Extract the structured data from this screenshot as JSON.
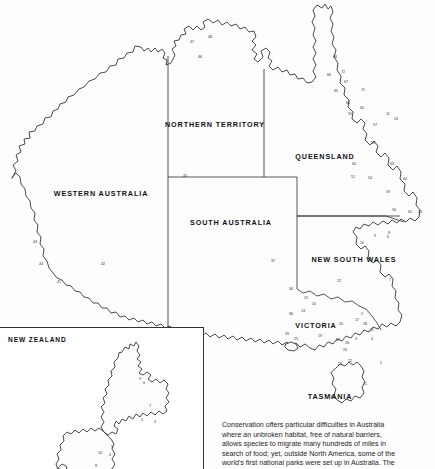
{
  "document": {
    "title": "Australia and New Zealand national parks map"
  },
  "main_map": {
    "name": "australia",
    "state_labels": [
      {
        "id": "western-australia",
        "text": "WESTERN AUSTRALIA",
        "x": 101,
        "y": 193
      },
      {
        "id": "northern-territory",
        "text": "NORTHERN TERRITORY",
        "x": 215,
        "y": 124
      },
      {
        "id": "south-australia",
        "text": "SOUTH AUSTRALIA",
        "x": 231,
        "y": 222
      },
      {
        "id": "queensland",
        "text": "QUEENSLAND",
        "x": 325,
        "y": 156
      },
      {
        "id": "new-south-wales",
        "text": "NEW SOUTH WALES",
        "x": 354,
        "y": 259
      },
      {
        "id": "victoria",
        "text": "VICTORIA",
        "x": 316,
        "y": 325
      },
      {
        "id": "tasmania",
        "text": "TASMANIA",
        "x": 330,
        "y": 396
      }
    ],
    "park_numbers": [
      {
        "n": "48",
        "x": 210,
        "y": 38
      },
      {
        "n": "47",
        "x": 192,
        "y": 43
      },
      {
        "n": "46",
        "x": 200,
        "y": 58
      },
      {
        "n": "45",
        "x": 185,
        "y": 177
      },
      {
        "n": "43",
        "x": 35,
        "y": 243
      },
      {
        "n": "44",
        "x": 41,
        "y": 265
      },
      {
        "n": "42",
        "x": 103,
        "y": 265
      },
      {
        "n": "41",
        "x": 59,
        "y": 283
      },
      {
        "n": "37",
        "x": 273,
        "y": 262
      },
      {
        "n": "68",
        "x": 335,
        "y": 58
      },
      {
        "n": "66",
        "x": 329,
        "y": 76
      },
      {
        "n": "72",
        "x": 343,
        "y": 73
      },
      {
        "n": "67",
        "x": 346,
        "y": 83
      },
      {
        "n": "65",
        "x": 336,
        "y": 92
      },
      {
        "n": "71",
        "x": 363,
        "y": 91
      },
      {
        "n": "61",
        "x": 348,
        "y": 104
      },
      {
        "n": "65",
        "x": 362,
        "y": 109
      },
      {
        "n": "55",
        "x": 350,
        "y": 115
      },
      {
        "n": "11",
        "x": 388,
        "y": 115
      },
      {
        "n": "14",
        "x": 396,
        "y": 120
      },
      {
        "n": "57",
        "x": 375,
        "y": 126
      },
      {
        "n": "58",
        "x": 373,
        "y": 144
      },
      {
        "n": "64",
        "x": 354,
        "y": 165
      },
      {
        "n": "63",
        "x": 392,
        "y": 165
      },
      {
        "n": "51",
        "x": 353,
        "y": 178
      },
      {
        "n": "54",
        "x": 370,
        "y": 179
      },
      {
        "n": "64",
        "x": 405,
        "y": 180
      },
      {
        "n": "59",
        "x": 388,
        "y": 193
      },
      {
        "n": "56",
        "x": 394,
        "y": 211
      },
      {
        "n": "62",
        "x": 410,
        "y": 213
      },
      {
        "n": "53",
        "x": 420,
        "y": 213
      },
      {
        "n": "9",
        "x": 375,
        "y": 237
      },
      {
        "n": "6",
        "x": 388,
        "y": 238
      },
      {
        "n": "8",
        "x": 389,
        "y": 234
      },
      {
        "n": "10",
        "x": 362,
        "y": 244
      },
      {
        "n": "7",
        "x": 390,
        "y": 281
      },
      {
        "n": "12",
        "x": 339,
        "y": 282
      },
      {
        "n": "34",
        "x": 291,
        "y": 290
      },
      {
        "n": "15",
        "x": 306,
        "y": 299
      },
      {
        "n": "16",
        "x": 314,
        "y": 305
      },
      {
        "n": "13",
        "x": 303,
        "y": 312
      },
      {
        "n": "36",
        "x": 291,
        "y": 315
      },
      {
        "n": "20",
        "x": 341,
        "y": 325
      },
      {
        "n": "17",
        "x": 357,
        "y": 321
      },
      {
        "n": "18",
        "x": 365,
        "y": 325
      },
      {
        "n": "2",
        "x": 362,
        "y": 315
      },
      {
        "n": "31",
        "x": 372,
        "y": 331
      },
      {
        "n": "19",
        "x": 320,
        "y": 337
      },
      {
        "n": "29",
        "x": 287,
        "y": 335
      },
      {
        "n": "25",
        "x": 296,
        "y": 340
      },
      {
        "n": "27",
        "x": 338,
        "y": 341
      },
      {
        "n": "26",
        "x": 347,
        "y": 344
      },
      {
        "n": "3",
        "x": 356,
        "y": 340
      },
      {
        "n": "4",
        "x": 372,
        "y": 340
      },
      {
        "n": "24",
        "x": 345,
        "y": 351
      },
      {
        "n": "23",
        "x": 340,
        "y": 365
      },
      {
        "n": "22",
        "x": 350,
        "y": 362
      },
      {
        "n": "5",
        "x": 381,
        "y": 364
      },
      {
        "n": "21",
        "x": 365,
        "y": 385
      },
      {
        "n": "30",
        "x": 332,
        "y": 398
      }
    ]
  },
  "nz_inset": {
    "title": "NEW ZEALAND",
    "park_numbers": [
      {
        "n": "9",
        "x": 140,
        "y": 52
      },
      {
        "n": "6",
        "x": 144,
        "y": 56
      },
      {
        "n": "7",
        "x": 150,
        "y": 79
      },
      {
        "n": "2",
        "x": 142,
        "y": 93
      },
      {
        "n": "3",
        "x": 155,
        "y": 95
      },
      {
        "n": "5",
        "x": 112,
        "y": 120
      },
      {
        "n": "10",
        "x": 100,
        "y": 126
      },
      {
        "n": "4",
        "x": 110,
        "y": 128
      },
      {
        "n": "8",
        "x": 96,
        "y": 139
      }
    ]
  },
  "caption": {
    "lines": [
      "Conservation offers particular difficulties in Australia",
      "where an unbroken habitat, free of natural barriers,",
      "allows species to migrate many hundreds of miles in",
      "search of food; yet, outside North America, some of the",
      "world's first national parks were set up in Australia. The"
    ]
  },
  "colors": {
    "ink": "#2b2b2b",
    "paper": "#ffffff",
    "text": "#1d1d1d"
  }
}
